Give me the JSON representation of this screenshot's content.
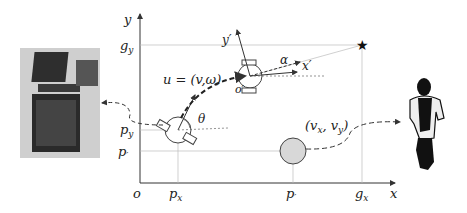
{
  "diagram": {
    "axes": {
      "x_label": "x",
      "y_label": "y",
      "origin_label": "o"
    },
    "ticks": {
      "px": "p",
      "px_sub": "x",
      "pxp": "p",
      "pxp_sub": "x",
      "gx": "g",
      "gx_sub": "x",
      "gy": "g",
      "gy_sub": "y",
      "py": "p",
      "py_sub": "y",
      "pyp": "p",
      "pyp_sub": "y"
    },
    "labels": {
      "control": "u = (v,ω)",
      "theta": "θ",
      "alpha": "α",
      "robot_frame_x": "x′",
      "robot_frame_y": "y′",
      "robot_frame_origin": "o′",
      "human_velocity": "(v",
      "human_velocity_x_sub": "x",
      "human_velocity_mid": ", v",
      "human_velocity_y_sub": "y",
      "human_velocity_end": ")"
    },
    "goal_marker": "★",
    "colors": {
      "axis": "#333333",
      "grid": "#bbbbbb",
      "human_fill": "#d8d8d8",
      "robot_stroke": "#444444"
    }
  }
}
